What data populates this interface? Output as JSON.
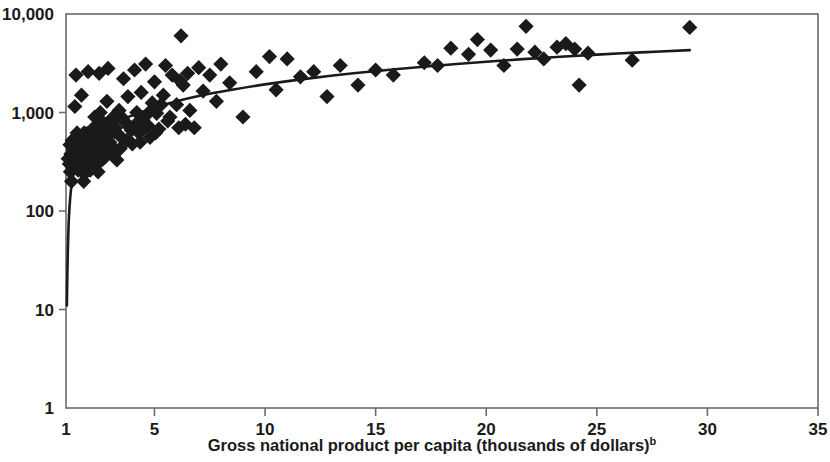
{
  "figure": {
    "background_color": "#ffffff",
    "ink_color": "#1a1a1a",
    "frame_color": "#6b6b6b"
  },
  "axes": {
    "x": {
      "label_text": "Gross national product per capita (thousands of dollars)",
      "label_superscript": "b",
      "scale": "linear",
      "min": 1,
      "max": 35,
      "ticks": [
        1,
        5,
        10,
        15,
        20,
        25,
        30,
        35
      ],
      "tick_labels": [
        "1",
        "5",
        "10",
        "15",
        "20",
        "25",
        "30",
        "35"
      ]
    },
    "y": {
      "label_text": "",
      "scale": "log",
      "min": 1,
      "max": 10000,
      "ticks": [
        1,
        10,
        100,
        1000,
        10000
      ],
      "tick_labels": [
        "1",
        "10",
        "100",
        "1,000",
        "10,000"
      ]
    }
  },
  "chart_data": {
    "type": "scatter",
    "title": "",
    "subtitle": "",
    "xlabel": "Gross national product per capita (thousands of dollars)b",
    "ylabel": "",
    "xlim": [
      1,
      35
    ],
    "ylim": [
      1,
      10000
    ],
    "xscale": "linear",
    "yscale": "log",
    "grid": false,
    "legend": "none",
    "marker": "diamond",
    "marker_color": "#1a1a1a",
    "annotations": [
      "b"
    ],
    "series": [
      {
        "name": "Countries",
        "marker": "diamond",
        "points": [
          [
            1.15,
            300
          ],
          [
            1.2,
            250
          ],
          [
            1.25,
            200
          ],
          [
            1.3,
            330
          ],
          [
            1.35,
            430
          ],
          [
            1.4,
            1150
          ],
          [
            1.45,
            2400
          ],
          [
            1.5,
            620
          ],
          [
            1.5,
            300
          ],
          [
            1.55,
            260
          ],
          [
            1.6,
            420
          ],
          [
            1.65,
            540
          ],
          [
            1.7,
            1500
          ],
          [
            1.75,
            250
          ],
          [
            1.8,
            200
          ],
          [
            1.85,
            350
          ],
          [
            1.9,
            470
          ],
          [
            1.95,
            610
          ],
          [
            2.0,
            2600
          ],
          [
            2.05,
            330
          ],
          [
            2.1,
            260
          ],
          [
            2.15,
            430
          ],
          [
            2.2,
            560
          ],
          [
            2.25,
            700
          ],
          [
            2.3,
            900
          ],
          [
            2.35,
            380
          ],
          [
            2.4,
            300
          ],
          [
            2.45,
            250
          ],
          [
            2.5,
            2500
          ],
          [
            2.55,
            1000
          ],
          [
            2.6,
            520
          ],
          [
            2.65,
            660
          ],
          [
            2.7,
            420
          ],
          [
            2.75,
            350
          ],
          [
            2.8,
            760
          ],
          [
            2.85,
            1300
          ],
          [
            2.9,
            2800
          ],
          [
            2.95,
            600
          ],
          [
            3.0,
            470
          ],
          [
            3.05,
            390
          ],
          [
            3.1,
            880
          ],
          [
            3.2,
            640
          ],
          [
            3.3,
            330
          ],
          [
            3.4,
            1050
          ],
          [
            3.5,
            560
          ],
          [
            3.6,
            2200
          ],
          [
            3.7,
            790
          ],
          [
            3.8,
            1450
          ],
          [
            3.9,
            700
          ],
          [
            4.0,
            480
          ],
          [
            4.1,
            2700
          ],
          [
            4.2,
            1000
          ],
          [
            4.3,
            620
          ],
          [
            4.4,
            1600
          ],
          [
            4.5,
            880
          ],
          [
            4.6,
            3100
          ],
          [
            4.7,
            740
          ],
          [
            4.8,
            560
          ],
          [
            4.9,
            1250
          ],
          [
            5.0,
            2050
          ],
          [
            5.1,
            980
          ],
          [
            5.2,
            680
          ],
          [
            5.4,
            1500
          ],
          [
            5.5,
            3000
          ],
          [
            5.6,
            820
          ],
          [
            5.8,
            2400
          ],
          [
            6.0,
            1200
          ],
          [
            6.1,
            700
          ],
          [
            6.2,
            6000
          ],
          [
            6.3,
            1900
          ],
          [
            6.4,
            760
          ],
          [
            6.5,
            2500
          ],
          [
            6.6,
            1050
          ],
          [
            6.8,
            700
          ],
          [
            7.0,
            2850
          ],
          [
            7.2,
            1650
          ],
          [
            7.5,
            2400
          ],
          [
            7.8,
            1300
          ],
          [
            8.0,
            3100
          ],
          [
            8.4,
            2000
          ],
          [
            9.0,
            900
          ],
          [
            9.6,
            2600
          ],
          [
            10.2,
            3700
          ],
          [
            10.5,
            1700
          ],
          [
            11.0,
            3500
          ],
          [
            11.6,
            2300
          ],
          [
            12.2,
            2600
          ],
          [
            12.8,
            1450
          ],
          [
            13.4,
            3000
          ],
          [
            14.2,
            1900
          ],
          [
            15.0,
            2700
          ],
          [
            15.8,
            2400
          ],
          [
            17.2,
            3200
          ],
          [
            17.8,
            3000
          ],
          [
            18.4,
            4500
          ],
          [
            19.2,
            3900
          ],
          [
            19.6,
            5500
          ],
          [
            20.2,
            4300
          ],
          [
            20.8,
            3000
          ],
          [
            21.4,
            4400
          ],
          [
            21.8,
            7500
          ],
          [
            22.2,
            4100
          ],
          [
            22.6,
            3500
          ],
          [
            23.2,
            4600
          ],
          [
            23.6,
            5000
          ],
          [
            24.0,
            4400
          ],
          [
            24.2,
            1900
          ],
          [
            24.6,
            4000
          ],
          [
            26.6,
            3400
          ],
          [
            29.2,
            7300
          ],
          [
            1.1,
            340
          ],
          [
            1.18,
            470
          ],
          [
            1.22,
            380
          ],
          [
            1.28,
            520
          ],
          [
            1.33,
            420
          ],
          [
            1.42,
            300
          ],
          [
            1.48,
            350
          ],
          [
            1.52,
            480
          ],
          [
            1.58,
            560
          ],
          [
            1.62,
            330
          ],
          [
            1.68,
            260
          ],
          [
            1.72,
            400
          ],
          [
            1.78,
            470
          ],
          [
            1.82,
            620
          ],
          [
            1.88,
            300
          ],
          [
            1.92,
            250
          ],
          [
            2.02,
            380
          ],
          [
            2.08,
            500
          ],
          [
            2.12,
            330
          ],
          [
            2.18,
            280
          ],
          [
            2.22,
            620
          ],
          [
            2.28,
            440
          ],
          [
            2.32,
            350
          ],
          [
            2.38,
            700
          ],
          [
            2.42,
            480
          ],
          [
            2.48,
            390
          ],
          [
            2.52,
            560
          ],
          [
            2.58,
            420
          ],
          [
            2.62,
            330
          ],
          [
            2.68,
            790
          ],
          [
            2.72,
            560
          ],
          [
            2.78,
            440
          ],
          [
            2.88,
            640
          ],
          [
            2.98,
            500
          ],
          [
            3.15,
            420
          ],
          [
            3.25,
            700
          ],
          [
            3.45,
            430
          ],
          [
            3.55,
            880
          ],
          [
            3.75,
            520
          ],
          [
            3.95,
            660
          ],
          [
            4.15,
            760
          ],
          [
            4.35,
            500
          ],
          [
            4.55,
            700
          ],
          [
            4.75,
            1000
          ],
          [
            5.05,
            620
          ],
          [
            5.3,
            1200
          ],
          [
            5.7,
            900
          ],
          [
            6.15,
            2100
          ]
        ]
      }
    ],
    "fit_curve": {
      "name": "Fitted logarithmic trend",
      "style": "solid-black-line",
      "x_start": 1.04,
      "x_end": 29.2,
      "points": [
        [
          1.04,
          11
        ],
        [
          1.06,
          22
        ],
        [
          1.09,
          45
        ],
        [
          1.12,
          75
        ],
        [
          1.16,
          110
        ],
        [
          1.22,
          160
        ],
        [
          1.3,
          215
        ],
        [
          1.4,
          275
        ],
        [
          1.55,
          345
        ],
        [
          1.75,
          420
        ],
        [
          2.0,
          500
        ],
        [
          2.3,
          580
        ],
        [
          2.7,
          670
        ],
        [
          3.1,
          760
        ],
        [
          3.6,
          860
        ],
        [
          4.2,
          970
        ],
        [
          5.0,
          1120
        ],
        [
          6.0,
          1300
        ],
        [
          7.0,
          1470
        ],
        [
          8.5,
          1700
        ],
        [
          10.0,
          1930
        ],
        [
          12.0,
          2220
        ],
        [
          14.0,
          2500
        ],
        [
          16.0,
          2760
        ],
        [
          18.0,
          3020
        ],
        [
          20.0,
          3280
        ],
        [
          22.5,
          3580
        ],
        [
          25.0,
          3870
        ],
        [
          27.0,
          4080
        ],
        [
          29.2,
          4300
        ]
      ]
    }
  }
}
